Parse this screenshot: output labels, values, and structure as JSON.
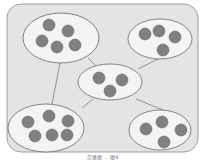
{
  "diagram": {
    "background": "#e4e4e4",
    "border": "#8a8a8a",
    "cluster_fill": "#f4f4f4",
    "node_fill": "#808080",
    "node_stroke": "#6a6a6a",
    "clusters": [
      {
        "id": "top-left",
        "cx": 61,
        "cy": 38,
        "rx": 38,
        "ry": 25,
        "nodes": [
          [
            49,
            25
          ],
          [
            68,
            31
          ],
          [
            42,
            41
          ],
          [
            57,
            47
          ],
          [
            75,
            45
          ]
        ]
      },
      {
        "id": "top-right",
        "cx": 160,
        "cy": 39,
        "rx": 32,
        "ry": 20,
        "nodes": [
          [
            145,
            34
          ],
          [
            159,
            31
          ],
          [
            175,
            37
          ],
          [
            163,
            50
          ]
        ]
      },
      {
        "id": "center",
        "cx": 110,
        "cy": 82,
        "rx": 32,
        "ry": 18,
        "nodes": [
          [
            99,
            78
          ],
          [
            122,
            80
          ],
          [
            110,
            91
          ]
        ]
      },
      {
        "id": "bottom-left",
        "cx": 46,
        "cy": 128,
        "rx": 38,
        "ry": 24,
        "nodes": [
          [
            28,
            122
          ],
          [
            49,
            116
          ],
          [
            68,
            121
          ],
          [
            35,
            136
          ],
          [
            52,
            135
          ],
          [
            67,
            135
          ]
        ]
      },
      {
        "id": "bottom-right",
        "cx": 160,
        "cy": 130,
        "rx": 31,
        "ry": 20,
        "nodes": [
          [
            146,
            129
          ],
          [
            162,
            122
          ],
          [
            181,
            130
          ],
          [
            164,
            142
          ]
        ]
      }
    ],
    "edges": [
      [
        88,
        58,
        97,
        67
      ],
      [
        60,
        63,
        52,
        104
      ],
      [
        138,
        69,
        160,
        58
      ],
      [
        93,
        99,
        82,
        108
      ],
      [
        136,
        99,
        163,
        110
      ]
    ],
    "caption": "示意图 ... 图4"
  }
}
